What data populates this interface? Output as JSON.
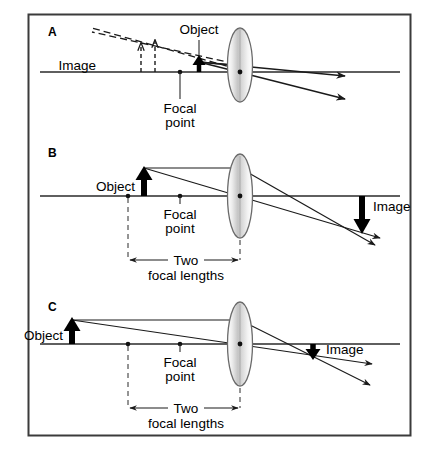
{
  "figure": {
    "border_color": "#3b3b3b",
    "background": "#ffffff",
    "ink_color": "#000000",
    "lens_fill_light": "#f2f2f2",
    "lens_fill_mid": "#c9c9c9",
    "lens_stroke": "#5a5a5a"
  },
  "panels": [
    {
      "id": "A",
      "label": "A",
      "description": "Object inside the focal point; virtual, enlarged, upright image on the same side of the lens.",
      "labels": {
        "object": "Object",
        "image": "Image",
        "focal_point_line1": "Focal",
        "focal_point_line2": "point"
      },
      "object": {
        "position_units": "just inside focal point",
        "orientation": "upright",
        "relative_height": "small"
      },
      "image": {
        "type": "virtual",
        "orientation": "upright",
        "relative_height": "enlarged",
        "style": "dashed"
      },
      "rays": {
        "count": 2,
        "after_lens": "diverging",
        "virtual_extension": "dashed back to image"
      },
      "has_dimension_line": false
    },
    {
      "id": "B",
      "label": "B",
      "description": "Object at two focal lengths; real, inverted image of equal size on the far side.",
      "labels": {
        "object": "Object",
        "image": "Image",
        "focal_point_line1": "Focal",
        "focal_point_line2": "point",
        "dimension_line1": "Two",
        "dimension_line2": "focal lengths"
      },
      "object": {
        "position_units": "two focal lengths",
        "orientation": "upright",
        "relative_height": "large"
      },
      "image": {
        "type": "real",
        "orientation": "inverted",
        "relative_height": "same size",
        "style": "solid"
      },
      "rays": {
        "count": 2,
        "after_lens": "converging",
        "virtual_extension": "none"
      },
      "has_dimension_line": true
    },
    {
      "id": "C",
      "label": "C",
      "description": "Object beyond two focal lengths; real, inverted, reduced image closer to the lens.",
      "labels": {
        "object": "Object",
        "image": "Image",
        "focal_point_line1": "Focal",
        "focal_point_line2": "point",
        "dimension_line1": "Two",
        "dimension_line2": "focal lengths"
      },
      "object": {
        "position_units": "beyond two focal lengths",
        "orientation": "upright",
        "relative_height": "large"
      },
      "image": {
        "type": "real",
        "orientation": "inverted",
        "relative_height": "reduced",
        "style": "solid"
      },
      "rays": {
        "count": 2,
        "after_lens": "converging",
        "virtual_extension": "none"
      },
      "has_dimension_line": true
    }
  ]
}
